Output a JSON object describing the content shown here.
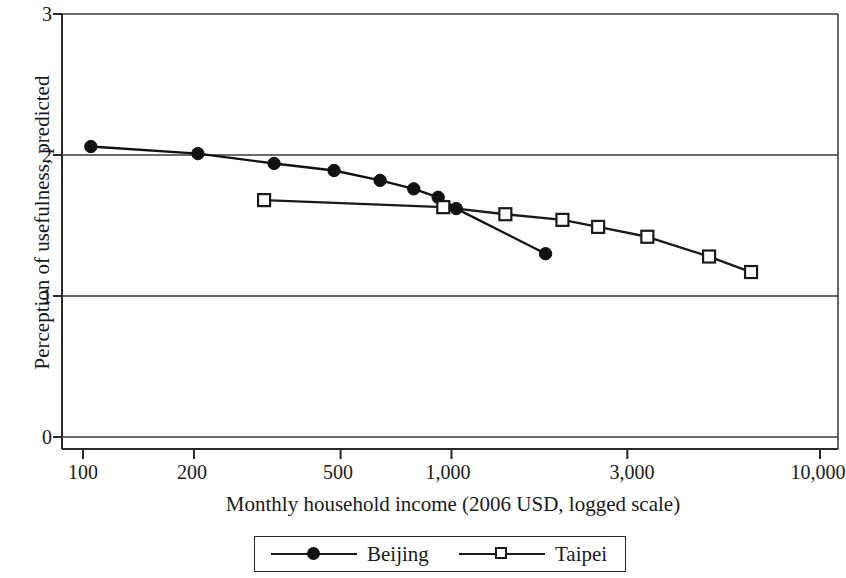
{
  "chart_data": {
    "type": "line",
    "title": "",
    "subtitle": "",
    "xlabel": "Monthly household income (2006 USD, logged scale)",
    "ylabel": "Perception of usefulness, predicted",
    "x_scale": "log",
    "xlim": [
      90,
      11000
    ],
    "ylim": [
      0,
      3
    ],
    "xticks": [
      100,
      200,
      500,
      1000,
      3000,
      10000
    ],
    "xtick_labels": [
      "100",
      "200",
      "500",
      "1,000",
      "3,000",
      "10,000"
    ],
    "yticks": [
      0,
      1,
      2,
      3
    ],
    "ytick_labels": [
      "0",
      "1",
      "2",
      "3"
    ],
    "grid": "horizontal",
    "legend_position": "bottom-center",
    "series": [
      {
        "name": "Beijing",
        "marker": "filled-circle",
        "color": "#111111",
        "points": [
          {
            "x": 105,
            "y": 2.06
          },
          {
            "x": 205,
            "y": 2.01
          },
          {
            "x": 330,
            "y": 1.94
          },
          {
            "x": 480,
            "y": 1.89
          },
          {
            "x": 640,
            "y": 1.82
          },
          {
            "x": 790,
            "y": 1.76
          },
          {
            "x": 920,
            "y": 1.7
          },
          {
            "x": 1030,
            "y": 1.62
          },
          {
            "x": 1800,
            "y": 1.3
          }
        ]
      },
      {
        "name": "Taipei",
        "marker": "open-square",
        "color": "#1a1a1a",
        "points": [
          {
            "x": 310,
            "y": 1.68
          },
          {
            "x": 950,
            "y": 1.63
          },
          {
            "x": 1400,
            "y": 1.58
          },
          {
            "x": 2000,
            "y": 1.54
          },
          {
            "x": 2500,
            "y": 1.49
          },
          {
            "x": 3400,
            "y": 1.42
          },
          {
            "x": 5000,
            "y": 1.28
          },
          {
            "x": 6500,
            "y": 1.17
          }
        ]
      }
    ]
  },
  "axes": {
    "ylabel": "Perception of usefulness, predicted",
    "xlabel": "Monthly household income (2006 USD, logged scale)",
    "ytick_0": "0",
    "ytick_1": "1",
    "ytick_2": "2",
    "ytick_3": "3",
    "xtick_0": "100",
    "xtick_1": "200",
    "xtick_2": "500",
    "xtick_3": "1,000",
    "xtick_4": "3,000",
    "xtick_5": "10,000"
  },
  "legend": {
    "beijing_label": "Beijing",
    "taipei_label": "Taipei"
  }
}
